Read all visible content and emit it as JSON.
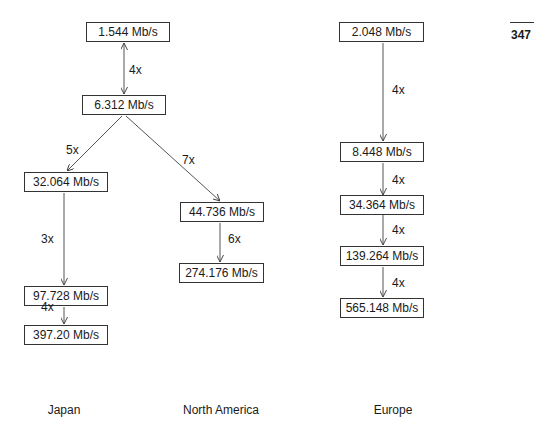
{
  "page_number": "347",
  "regions": [
    {
      "label": "Japan"
    },
    {
      "label": "North America"
    },
    {
      "label": "Europe"
    }
  ],
  "nodes": {
    "n1544": "1.544 Mb/s",
    "n6312": "6.312 Mb/s",
    "n32064": "32.064 Mb/s",
    "n97728": "97.728 Mb/s",
    "n39720": "397.20 Mb/s",
    "n44736": "44.736 Mb/s",
    "n274176": "274.176 Mb/s",
    "n2048": "2.048 Mb/s",
    "n8448": "8.448 Mb/s",
    "n34364": "34.364 Mb/s",
    "n139264": "139.264 Mb/s",
    "n565148": "565.148 Mb/s"
  },
  "edges": [
    {
      "from": "1.544 Mb/s",
      "to": "6.312 Mb/s",
      "label": "4x",
      "bidirectional": true
    },
    {
      "from": "6.312 Mb/s",
      "to": "32.064 Mb/s",
      "label": "5x"
    },
    {
      "from": "6.312 Mb/s",
      "to": "44.736 Mb/s",
      "label": "7x"
    },
    {
      "from": "32.064 Mb/s",
      "to": "97.728 Mb/s",
      "label": "3x"
    },
    {
      "from": "97.728 Mb/s",
      "to": "397.20 Mb/s",
      "label": "4x"
    },
    {
      "from": "44.736 Mb/s",
      "to": "274.176 Mb/s",
      "label": "6x"
    },
    {
      "from": "2.048 Mb/s",
      "to": "8.448 Mb/s",
      "label": "4x"
    },
    {
      "from": "8.448 Mb/s",
      "to": "34.364 Mb/s",
      "label": "4x"
    },
    {
      "from": "34.364 Mb/s",
      "to": "139.264 Mb/s",
      "label": "4x"
    },
    {
      "from": "139.264 Mb/s",
      "to": "565.148 Mb/s",
      "label": "4x"
    }
  ]
}
